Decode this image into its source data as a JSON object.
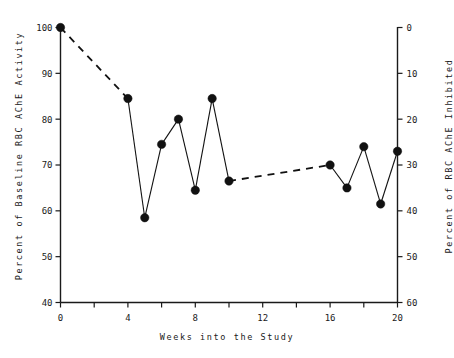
{
  "chart_data": {
    "type": "line",
    "title": "",
    "xlabel": "Weeks into the Study",
    "ylabel": "Percent of Baseline RBC AChE Activity",
    "ylabel_right": "Percent of RBC AChE Inhibited",
    "xlim": [
      0,
      21
    ],
    "ylim": [
      40,
      100
    ],
    "ylim_right": [
      0,
      60
    ],
    "xticks": [
      0,
      2,
      4,
      6,
      8,
      10,
      12,
      14,
      16,
      18,
      20
    ],
    "xtick_labels": [
      "0",
      "",
      "4",
      "",
      "8",
      "",
      "12",
      "",
      "16",
      "",
      "20"
    ],
    "yticks": [
      40,
      50,
      60,
      70,
      80,
      90,
      100
    ],
    "ytick_labels": [
      "40",
      "50",
      "60",
      "70",
      "80",
      "90",
      "100"
    ],
    "yticks_right": [
      0,
      10,
      20,
      30,
      40,
      50,
      60
    ],
    "ytick_labels_right": [
      "0",
      "10",
      "20",
      "30",
      "40",
      "50",
      "60"
    ],
    "grid": false,
    "legend": false,
    "marker": "filled-circle",
    "series": [
      {
        "name": "RBC AChE Activity",
        "x": [
          0,
          4,
          5,
          6,
          7,
          8,
          9,
          10,
          16,
          17,
          18,
          19,
          20
        ],
        "values": [
          100,
          84.5,
          58.5,
          74.5,
          80,
          64.5,
          84.5,
          66.5,
          70,
          65,
          74,
          61.5,
          73
        ],
        "inhibited": [
          0,
          15.5,
          41.5,
          25.5,
          20,
          35.5,
          15.5,
          33.5,
          30,
          35,
          26,
          38.5,
          27
        ]
      }
    ],
    "segments": [
      {
        "from_index": 0,
        "to_index": 1,
        "style": "dashed"
      },
      {
        "from_index": 1,
        "to_index": 2,
        "style": "solid"
      },
      {
        "from_index": 2,
        "to_index": 3,
        "style": "solid"
      },
      {
        "from_index": 3,
        "to_index": 4,
        "style": "solid"
      },
      {
        "from_index": 4,
        "to_index": 5,
        "style": "solid"
      },
      {
        "from_index": 5,
        "to_index": 6,
        "style": "solid"
      },
      {
        "from_index": 6,
        "to_index": 7,
        "style": "solid"
      },
      {
        "from_index": 7,
        "to_index": 8,
        "style": "dashed"
      },
      {
        "from_index": 8,
        "to_index": 9,
        "style": "solid"
      },
      {
        "from_index": 9,
        "to_index": 10,
        "style": "solid"
      },
      {
        "from_index": 10,
        "to_index": 11,
        "style": "solid"
      },
      {
        "from_index": 11,
        "to_index": 12,
        "style": "solid"
      }
    ],
    "colors": {
      "line": "#111111",
      "marker": "#111111",
      "axis": "#1a1a1a",
      "background": "#ffffff"
    }
  }
}
